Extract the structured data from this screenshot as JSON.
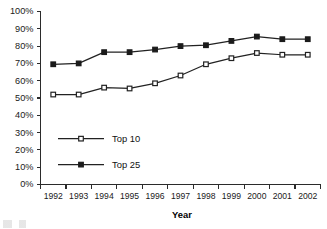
{
  "chart_data": {
    "type": "line",
    "title": "",
    "xlabel": "Year",
    "ylabel": "",
    "categories": [
      "1992",
      "1993",
      "1994",
      "1995",
      "1996",
      "1997",
      "1998",
      "1999",
      "2000",
      "2001",
      "2002"
    ],
    "series": [
      {
        "name": "Top 10",
        "marker": "open-square",
        "values": [
          52,
          52,
          56,
          55.5,
          58.5,
          63,
          69.5,
          73,
          76,
          75,
          75
        ]
      },
      {
        "name": "Top 25",
        "marker": "filled-square",
        "values": [
          69.5,
          70,
          76.5,
          76.5,
          78,
          80,
          80.5,
          83,
          85.5,
          84,
          84
        ]
      }
    ],
    "ylim": [
      0,
      100
    ],
    "ytick_values": [
      0,
      10,
      20,
      30,
      40,
      50,
      60,
      70,
      80,
      90,
      100
    ],
    "ytick_labels": [
      "0%",
      "10%",
      "20%",
      "30%",
      "40%",
      "50%",
      "60%",
      "70%",
      "80%",
      "90%",
      "100%"
    ],
    "grid": false,
    "legend_position": "inside-lower-left",
    "value_suffix": "%",
    "colors": {
      "line": "#222222",
      "marker_open_fill": "#ffffff",
      "marker_filled_fill": "#1b1b1b",
      "axis": "#2b2b2b",
      "background": "#ffffff"
    }
  },
  "legend": {
    "entries": [
      {
        "label": "Top 10"
      },
      {
        "label": "Top 25"
      }
    ]
  },
  "axes": {
    "x_title": "Year"
  }
}
